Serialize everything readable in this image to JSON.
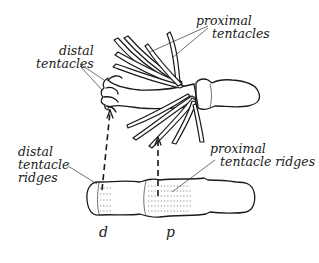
{
  "diagram": {
    "labels": {
      "distal_tentacles": [
        "distal",
        "tentacles"
      ],
      "proximal_tentacles": [
        "proximal",
        "tentacles"
      ],
      "distal_tentacle_ridges": [
        "distal",
        "tentacle",
        "ridges"
      ],
      "proximal_tentacle_ridges": [
        "proximal",
        "tentacle ridges"
      ],
      "marker_d": "d",
      "marker_p": "p"
    },
    "colors": {
      "ink": "#1a1a1a",
      "background": "#ffffff"
    }
  }
}
